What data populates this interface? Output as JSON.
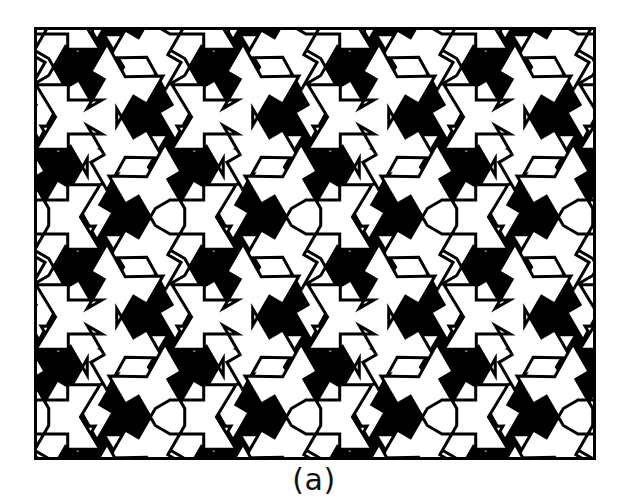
{
  "figure": {
    "caption": "(a)",
    "plate": {
      "x": 34,
      "y": 27,
      "width": 562,
      "height": 433,
      "border_color": "#000000",
      "border_width": 3
    },
    "colors": {
      "background": "#ffffff",
      "tile_dark": "#000000",
      "tile_light": "#ffffff",
      "outline": "#000000",
      "caption_text": "#111111"
    },
    "pattern": {
      "type": "hexagonal-triskelion",
      "motif_name": "three-armed pinwheel",
      "arm_count": 3,
      "lattice": "hexagonal",
      "lattice_a": 136,
      "lattice_row_height": 100,
      "arm_length": 66,
      "arm_half_width": 17,
      "outline_stroke": 3,
      "rotation_deg": 0,
      "columns": 7,
      "rows": 7,
      "colorings": [
        "light",
        "dark"
      ]
    }
  }
}
